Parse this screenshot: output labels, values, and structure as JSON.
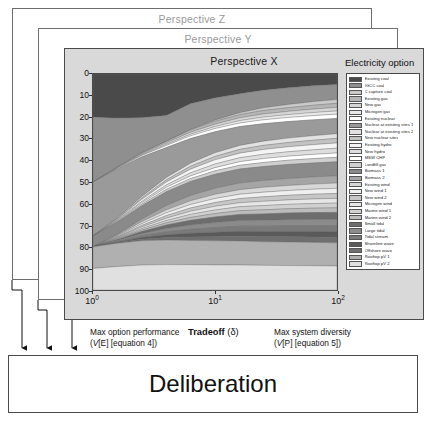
{
  "panels": [
    {
      "id": "z",
      "caption": "Perspective Z"
    },
    {
      "id": "y",
      "caption": "Perspective Y"
    },
    {
      "id": "x",
      "caption": "Perspective X"
    }
  ],
  "deliberation": {
    "label": "Deliberation"
  },
  "legend": {
    "title": "Electricity option"
  },
  "axes": {
    "y_label": "Portfolio composition (%)",
    "y_ticks": [
      "0",
      "10",
      "20",
      "30",
      "40",
      "50",
      "60",
      "70",
      "80",
      "90",
      "100"
    ],
    "x_ticks": [
      "10",
      "10",
      "10"
    ],
    "x_exponents": [
      "0",
      "1",
      "2"
    ],
    "x_center_label_bold": "Tradeoff",
    "x_center_label_symbol": "(δ)",
    "x_left_line1": "Max option performance",
    "x_left_line2_italic": "V",
    "x_left_line2_rest": "[E] [equation 4])",
    "x_right_line1": "Max system diversity",
    "x_right_line2_italic": "V",
    "x_right_line2_rest": "[P] [equation 5])"
  },
  "chart_data": {
    "type": "area",
    "title": "Perspective X",
    "xlabel": "Tradeoff (δ)",
    "ylabel": "Portfolio composition (%)",
    "xscale": "log",
    "xlim": [
      1,
      100
    ],
    "ylim": [
      0,
      100
    ],
    "y_inverted": true,
    "grid": false,
    "legend_position": "right",
    "x": [
      1,
      1.6,
      2.5,
      4,
      6.3,
      10,
      16,
      25,
      40,
      63,
      100
    ],
    "series": [
      {
        "name": "Existing coal",
        "color": "#4a4a4a",
        "values": [
          20.0,
          19.9,
          19.8,
          19.5,
          14.5,
          12.0,
          10.0,
          8.4,
          7.2,
          6.2,
          5.5
        ]
      },
      {
        "name": "IGCC coal",
        "color": "#8f8f8f",
        "values": [
          30.0,
          22.0,
          16.0,
          12.0,
          12.5,
          11.0,
          9.5,
          9.0,
          8.6,
          8.3,
          8.0
        ]
      },
      {
        "name": "C capture coal",
        "color": "#c9c9c9",
        "values": [
          0.0,
          0.0,
          0.0,
          0.0,
          0.2,
          0.6,
          1.0,
          1.4,
          1.7,
          1.9,
          2.0
        ]
      },
      {
        "name": "Existing gas",
        "color": "#b5b5b5",
        "values": [
          0.0,
          0.2,
          0.5,
          0.8,
          1.1,
          1.4,
          1.6,
          1.8,
          1.9,
          2.0,
          2.1
        ]
      },
      {
        "name": "New gas",
        "color": "#d5d5d5",
        "values": [
          0.0,
          0.2,
          0.4,
          0.7,
          1.0,
          1.2,
          1.4,
          1.6,
          1.7,
          1.8,
          1.9
        ]
      },
      {
        "name": "Microgen gas",
        "color": "#eaeaea",
        "values": [
          0.0,
          0.1,
          0.3,
          0.5,
          0.8,
          1.0,
          1.2,
          1.4,
          1.5,
          1.6,
          1.7
        ]
      },
      {
        "name": "Existing nuclear",
        "color": "#ffffff",
        "values": [
          0.0,
          0.3,
          0.6,
          1.0,
          1.3,
          1.6,
          1.8,
          2.0,
          2.1,
          2.2,
          2.3
        ]
      },
      {
        "name": "Nuclear at existing sites 1",
        "color": "#9a9a9a",
        "values": [
          25.0,
          22.0,
          18.0,
          14.0,
          12.0,
          10.5,
          9.5,
          9.0,
          8.6,
          8.3,
          8.0
        ]
      },
      {
        "name": "Nuclear at existing sites 2",
        "color": "#e2e2e2",
        "values": [
          0.0,
          0.3,
          0.7,
          1.1,
          1.5,
          1.8,
          2.0,
          2.2,
          2.3,
          2.4,
          2.5
        ]
      },
      {
        "name": "New nuclear sites",
        "color": "#c2c2c2",
        "values": [
          0.0,
          0.3,
          0.6,
          1.0,
          1.4,
          1.7,
          1.9,
          2.1,
          2.2,
          2.3,
          2.4
        ]
      },
      {
        "name": "Existing hydro",
        "color": "#f4f4f4",
        "values": [
          0.0,
          0.4,
          0.9,
          1.4,
          1.8,
          2.1,
          2.3,
          2.5,
          2.6,
          2.7,
          2.8
        ]
      },
      {
        "name": "New hydro",
        "color": "#dedede",
        "values": [
          0.0,
          0.3,
          0.7,
          1.1,
          1.5,
          1.8,
          2.0,
          2.2,
          2.3,
          2.4,
          2.5
        ]
      },
      {
        "name": "MSW CHP",
        "color": "#ffffff",
        "values": [
          0.0,
          0.3,
          0.6,
          1.0,
          1.3,
          1.6,
          1.8,
          2.0,
          2.1,
          2.2,
          2.3
        ]
      },
      {
        "name": "Landfill gas",
        "color": "#cfcfcf",
        "values": [
          0.0,
          0.3,
          0.7,
          1.1,
          1.4,
          1.7,
          1.9,
          2.1,
          2.2,
          2.3,
          2.4
        ]
      },
      {
        "name": "Biomass 1",
        "color": "#8a8a8a",
        "values": [
          5.0,
          5.5,
          6.0,
          6.5,
          6.8,
          7.0,
          7.1,
          7.2,
          7.3,
          7.3,
          7.4
        ]
      },
      {
        "name": "Biomass 2",
        "color": "#a5a5a5",
        "values": [
          0.0,
          0.5,
          1.2,
          2.0,
          2.6,
          3.0,
          3.3,
          3.5,
          3.6,
          3.7,
          3.8
        ]
      },
      {
        "name": "Existing wind",
        "color": "#d8d8d8",
        "values": [
          0.0,
          0.4,
          0.9,
          1.4,
          1.8,
          2.1,
          2.3,
          2.5,
          2.6,
          2.7,
          2.8
        ]
      },
      {
        "name": "New wind 1",
        "color": "#efefef",
        "values": [
          0.0,
          0.4,
          0.8,
          1.3,
          1.7,
          2.0,
          2.2,
          2.4,
          2.5,
          2.6,
          2.7
        ]
      },
      {
        "name": "New wind 2",
        "color": "#c6c6c6",
        "values": [
          0.0,
          0.3,
          0.7,
          1.2,
          1.6,
          1.9,
          2.1,
          2.3,
          2.4,
          2.5,
          2.6
        ]
      },
      {
        "name": "Microgen wind",
        "color": "#e6e6e6",
        "values": [
          0.0,
          0.3,
          0.7,
          1.1,
          1.5,
          1.8,
          2.0,
          2.2,
          2.3,
          2.4,
          2.5
        ]
      },
      {
        "name": "Marine wind 1",
        "color": "#d0d0d0",
        "values": [
          0.0,
          0.3,
          0.7,
          1.1,
          1.5,
          1.8,
          2.0,
          2.2,
          2.3,
          2.4,
          2.5
        ]
      },
      {
        "name": "Marine wind 2",
        "color": "#bcbcbc",
        "values": [
          0.0,
          0.3,
          0.6,
          1.0,
          1.4,
          1.7,
          1.9,
          2.1,
          2.2,
          2.3,
          2.4
        ]
      },
      {
        "name": "Small tidal",
        "color": "#6d6d6d",
        "values": [
          0.0,
          0.4,
          1.0,
          1.7,
          2.3,
          2.8,
          3.1,
          3.3,
          3.5,
          3.6,
          3.7
        ]
      },
      {
        "name": "Large tidal",
        "color": "#8b8b8b",
        "values": [
          0.0,
          0.4,
          0.9,
          1.5,
          2.1,
          2.5,
          2.8,
          3.0,
          3.2,
          3.3,
          3.4
        ]
      },
      {
        "name": "Tidal stream",
        "color": "#7a7a7a",
        "values": [
          0.0,
          0.3,
          0.8,
          1.4,
          1.9,
          2.3,
          2.6,
          2.8,
          2.9,
          3.0,
          3.1
        ]
      },
      {
        "name": "Shoreline wave",
        "color": "#5a5a5a",
        "values": [
          0.0,
          0.3,
          0.8,
          1.3,
          1.8,
          2.2,
          2.5,
          2.7,
          2.8,
          2.9,
          3.0
        ]
      },
      {
        "name": "Offshore wave",
        "color": "#6f6f6f",
        "values": [
          0.0,
          0.3,
          0.7,
          1.2,
          1.7,
          2.1,
          2.4,
          2.6,
          2.7,
          2.8,
          2.9
        ]
      },
      {
        "name": "Rooftop pV 1",
        "color": "#b0b0b0",
        "values": [
          10.0,
          10.5,
          11.0,
          11.5,
          11.8,
          12.0,
          12.1,
          12.1,
          12.2,
          12.2,
          12.2
        ]
      },
      {
        "name": "Rooftop pV 2",
        "color": "#e0e0e0",
        "values": [
          10.0,
          10.6,
          11.3,
          11.9,
          12.3,
          12.5,
          12.6,
          12.7,
          12.7,
          12.7,
          12.7
        ]
      }
    ]
  }
}
